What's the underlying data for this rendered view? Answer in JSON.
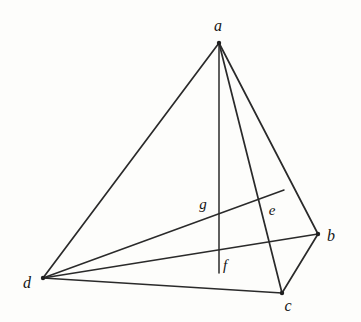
{
  "figure": {
    "background_color": "#fdfdfb",
    "stroke_color": "#2a2a2a",
    "label_color": "#141414",
    "width": 361,
    "height": 322
  },
  "chart_data": {
    "type": "diagram",
    "xlabel": "",
    "ylabel": "",
    "grid": false,
    "legend": null,
    "xlim": [
      0,
      361
    ],
    "ylim": [
      0,
      322
    ],
    "points": [
      {
        "name": "a",
        "label": "a",
        "x": 219,
        "y": 43,
        "label_x": 218,
        "label_y": 26,
        "kind": "vertex",
        "dot": true
      },
      {
        "name": "b",
        "label": "b",
        "x": 318,
        "y": 234,
        "label_x": 331,
        "label_y": 236,
        "kind": "vertex",
        "dot": true
      },
      {
        "name": "c",
        "label": "c",
        "x": 282,
        "y": 293,
        "label_x": 288,
        "label_y": 306,
        "kind": "vertex",
        "dot": true
      },
      {
        "name": "d",
        "label": "d",
        "x": 43,
        "y": 278,
        "label_x": 27,
        "label_y": 283,
        "kind": "vertex",
        "dot": true
      },
      {
        "name": "e",
        "label": "e",
        "x": 261,
        "y": 204,
        "label_x": 272,
        "label_y": 210,
        "kind": "interior",
        "dot": false
      },
      {
        "name": "f",
        "label": "f",
        "x": 219,
        "y": 272,
        "label_x": 225,
        "label_y": 265,
        "kind": "interior",
        "dot": false
      },
      {
        "name": "g",
        "label": "g",
        "x": 220,
        "y": 209,
        "label_x": 203,
        "label_y": 204,
        "kind": "interior",
        "dot": false
      }
    ],
    "segments": [
      {
        "name": "edge-a-d",
        "from": "a",
        "to": "d",
        "x1": 219,
        "y1": 43,
        "x2": 43,
        "y2": 278
      },
      {
        "name": "edge-a-b",
        "from": "a",
        "to": "b",
        "x1": 219,
        "y1": 43,
        "x2": 318,
        "y2": 234
      },
      {
        "name": "edge-a-c",
        "from": "a",
        "to": "c",
        "x1": 219,
        "y1": 43,
        "x2": 282,
        "y2": 293
      },
      {
        "name": "edge-d-b",
        "from": "d",
        "to": "b",
        "x1": 43,
        "y1": 278,
        "x2": 318,
        "y2": 234
      },
      {
        "name": "edge-d-c",
        "from": "d",
        "to": "c",
        "x1": 43,
        "y1": 278,
        "x2": 282,
        "y2": 293
      },
      {
        "name": "edge-b-c",
        "from": "b",
        "to": "c",
        "x1": 318,
        "y1": 234,
        "x2": 282,
        "y2": 293
      },
      {
        "name": "cevian-a-f",
        "from": "a",
        "to": "f",
        "x1": 219,
        "y1": 43,
        "x2": 219,
        "y2": 273
      },
      {
        "name": "cevian-d-e-extended",
        "from": "d",
        "to": "e",
        "x1": 43,
        "y1": 278,
        "x2": 284,
        "y2": 190
      }
    ],
    "vertex_labels": [
      "a",
      "b",
      "c",
      "d"
    ],
    "interior_labels": [
      "e",
      "f",
      "g"
    ]
  }
}
